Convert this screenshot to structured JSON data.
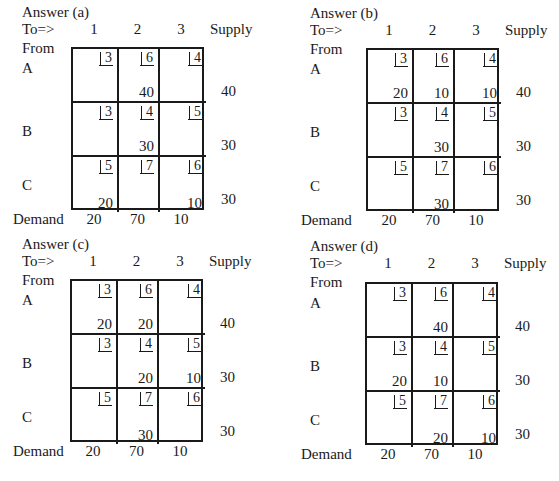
{
  "labels": {
    "to": "To=>",
    "from": "From",
    "supply": "Supply",
    "demand": "Demand",
    "columns": [
      "1",
      "2",
      "3"
    ],
    "rows": [
      "A",
      "B",
      "C"
    ]
  },
  "costs": [
    [
      "3",
      "6",
      "4"
    ],
    [
      "3",
      "4",
      "5"
    ],
    [
      "5",
      "7",
      "6"
    ]
  ],
  "supply": [
    "40",
    "30",
    "30"
  ],
  "demand": [
    "20",
    "70",
    "10"
  ],
  "panels": [
    {
      "title": "Answer (a)",
      "allocations": [
        [
          "",
          "40",
          ""
        ],
        [
          "",
          "30",
          ""
        ],
        [
          "20",
          "",
          "10"
        ]
      ]
    },
    {
      "title": "Answer (b)",
      "allocations": [
        [
          "20",
          "10",
          "10"
        ],
        [
          "",
          "30",
          ""
        ],
        [
          "",
          "30",
          ""
        ]
      ]
    },
    {
      "title": "Answer (c)",
      "allocations": [
        [
          "20",
          "20",
          ""
        ],
        [
          "",
          "20",
          "10"
        ],
        [
          "",
          "30",
          ""
        ]
      ]
    },
    {
      "title": "Answer (d)",
      "allocations": [
        [
          "",
          "40",
          ""
        ],
        [
          "20",
          "10",
          ""
        ],
        [
          "",
          "20",
          "10"
        ]
      ]
    }
  ]
}
